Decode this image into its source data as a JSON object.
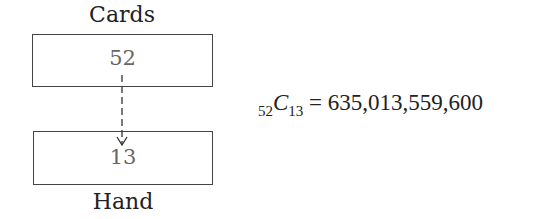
{
  "diagram": {
    "top_label": "Cards",
    "bottom_label": "Hand",
    "top_box_value": "52",
    "bottom_box_value": "13",
    "arrow": {
      "from": "top_box",
      "to": "bottom_box",
      "style": "dashed"
    }
  },
  "formula": {
    "pre_subscript": "52",
    "symbol": "C",
    "subscript": "13",
    "equals": "=",
    "result": "635,013,559,600"
  }
}
